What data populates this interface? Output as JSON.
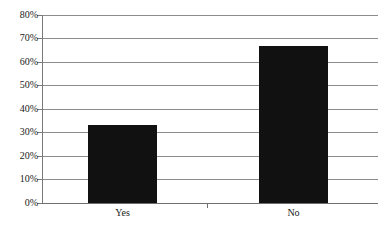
{
  "chart_data": {
    "type": "bar",
    "title": "",
    "subtitle": "",
    "xlabel": "",
    "ylabel": "",
    "categories": [
      "Yes",
      "No"
    ],
    "values": [
      33,
      67
    ],
    "value_labels": [
      "33%",
      "67%"
    ],
    "ylim": [
      0,
      80
    ],
    "ytick_labels": [
      "0%",
      "10%",
      "20%",
      "30%",
      "40%",
      "50%",
      "60%",
      "70%",
      "80%"
    ],
    "ytick_values": [
      0,
      10,
      20,
      30,
      40,
      50,
      60,
      70,
      80
    ],
    "grid": "horizontal",
    "legend": "none",
    "series": [
      {
        "name": "",
        "values": [
          33,
          67
        ],
        "color": "#111111"
      }
    ],
    "colors": {
      "bar": "#111111",
      "gridline": "#8c8c8c",
      "axis": "#6e6e6e",
      "background": "#ffffff",
      "text": "#1a1a1a"
    }
  }
}
